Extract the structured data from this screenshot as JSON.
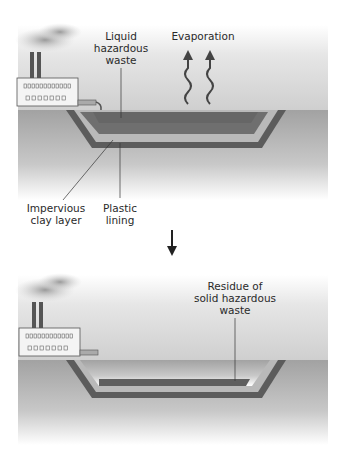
{
  "diagram": {
    "panel_top": {
      "labels": {
        "liquid_waste": "Liquid\nhazardous\nwaste",
        "evaporation": "Evaporation",
        "clay_layer": "Impervious\nclay layer",
        "plastic_lining": "Plastic\nlining"
      }
    },
    "transition_arrow": "down-arrow",
    "panel_bottom": {
      "labels": {
        "residue": "Residue of\nsolid hazardous\nwaste"
      }
    },
    "colors": {
      "ground_top": "#9a9a9a",
      "ground_fade": "#ffffff",
      "clay": "#5a5a5a",
      "lining": "#b8b8b8",
      "liquid": "#6e6e6e",
      "factory": "#f4f4f4",
      "sky": "#d8d8d8"
    }
  }
}
